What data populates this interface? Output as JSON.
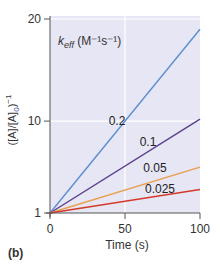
{
  "chart_data": {
    "type": "line",
    "title": "",
    "panel_label": "(b)",
    "xlabel": "Time (s)",
    "ylabel": "([A]/[A]0)^-1",
    "ylabel_parts": {
      "main": "([A]/[A]",
      "sub": "0",
      "tail": ")",
      "sup": "−1"
    },
    "legend_title": {
      "symbol": "k",
      "subscript": "eff",
      "units": "(M⁻¹s⁻¹)"
    },
    "xlim": [
      0,
      100
    ],
    "ylim": [
      1,
      20
    ],
    "x_ticks": [
      0,
      50,
      100
    ],
    "y_ticks": [
      1,
      10,
      20
    ],
    "grid": true,
    "x": [
      0,
      100
    ],
    "series": [
      {
        "name": "0.2",
        "label": "0.2",
        "values": [
          1,
          19
        ],
        "color": "#5b8fcf"
      },
      {
        "name": "0.1",
        "label": "0.1",
        "values": [
          1,
          10.2
        ],
        "color": "#5b3f8f"
      },
      {
        "name": "0.05",
        "label": "0.05",
        "values": [
          1,
          5.5
        ],
        "color": "#e8a050"
      },
      {
        "name": "0.025",
        "label": "0.025",
        "values": [
          1,
          3.3
        ],
        "color": "#d43a2a"
      }
    ],
    "colors": {
      "plot_background": "#e6e6f4",
      "grid": "#ffffff",
      "axis": "#555555"
    }
  }
}
